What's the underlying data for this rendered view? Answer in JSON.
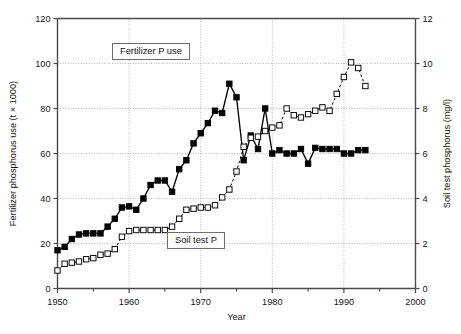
{
  "chart_data": {
    "type": "line",
    "title": "",
    "xlabel": "Year",
    "ylabel": "Fertilizer phosphorus use (t × 1000)",
    "y2label": "Soil test phosphorus (mg/l)",
    "xlim": [
      1950,
      2000
    ],
    "ylim": [
      0,
      120
    ],
    "y2lim": [
      0,
      12
    ],
    "xticks": [
      1950,
      1960,
      1970,
      1980,
      1990,
      2000
    ],
    "xtick_labels": [
      "1950",
      "1960",
      "1970",
      "1980",
      "1990",
      "2000"
    ],
    "xminor_ticks": [
      1955,
      1965,
      1975,
      1985,
      1995
    ],
    "yticks": [
      0,
      20,
      40,
      60,
      80,
      100,
      120
    ],
    "ytick_labels": [
      "0",
      "20",
      "40",
      "60",
      "80",
      "100",
      "120"
    ],
    "y2ticks": [
      0,
      2,
      4,
      6,
      8,
      10,
      12
    ],
    "y2tick_labels": [
      "0",
      "2",
      "4",
      "6",
      "8",
      "10",
      "12"
    ],
    "grid": true,
    "legend_position": "inline-annotations",
    "annotations": [
      {
        "text": "Fertilizer P use",
        "x": 1963.5,
        "y": 101
      },
      {
        "text": "Soil test P",
        "x": 1971.5,
        "y": 17
      }
    ],
    "series": [
      {
        "name": "Fertilizer P use",
        "axis": "left",
        "marker": "filled-square",
        "line_style": "solid",
        "color": "#000000",
        "units": "t × 1000",
        "x": [
          1950,
          1951,
          1952,
          1953,
          1954,
          1955,
          1956,
          1957,
          1958,
          1959,
          1960,
          1961,
          1962,
          1963,
          1964,
          1965,
          1966,
          1967,
          1968,
          1969,
          1970,
          1971,
          1972,
          1973,
          1974,
          1975,
          1976,
          1977,
          1978,
          1979,
          1980,
          1981,
          1982,
          1983,
          1984,
          1985,
          1986,
          1987,
          1988,
          1989,
          1990,
          1991,
          1992,
          1993
        ],
        "values": [
          17,
          18.5,
          22,
          24,
          24.5,
          24.5,
          24.5,
          27.5,
          31,
          36,
          36.5,
          35,
          40,
          46,
          48,
          48,
          43,
          53,
          57,
          64.5,
          69,
          73.5,
          79,
          78,
          91,
          85,
          57,
          68,
          62,
          80,
          60,
          61.5,
          60,
          60,
          62,
          55.5,
          62.5,
          62,
          62,
          62,
          60,
          60,
          61.5,
          61.5
        ]
      },
      {
        "name": "Soil test P",
        "axis": "right",
        "marker": "open-square",
        "line_style": "dashed",
        "color": "#000000",
        "units": "mg/l",
        "x": [
          1950,
          1951,
          1952,
          1953,
          1954,
          1955,
          1956,
          1957,
          1958,
          1959,
          1960,
          1961,
          1962,
          1963,
          1964,
          1965,
          1966,
          1967,
          1968,
          1969,
          1970,
          1971,
          1972,
          1973,
          1974,
          1975,
          1976,
          1977,
          1978,
          1979,
          1980,
          1981,
          1982,
          1983,
          1984,
          1985,
          1986,
          1987,
          1988,
          1989,
          1990,
          1991,
          1992,
          1993
        ],
        "values": [
          0.8,
          1.1,
          1.15,
          1.2,
          1.3,
          1.35,
          1.5,
          1.55,
          1.75,
          2.3,
          2.55,
          2.6,
          2.6,
          2.6,
          2.6,
          2.6,
          2.75,
          3.1,
          3.5,
          3.55,
          3.6,
          3.6,
          3.7,
          4.05,
          4.4,
          5.2,
          6.3,
          6.7,
          6.75,
          7.0,
          7.15,
          7.25,
          8.0,
          7.7,
          7.6,
          7.75,
          7.9,
          8.05,
          7.9,
          8.65,
          9.4,
          10.05,
          9.8,
          9.0
        ]
      }
    ]
  },
  "figure": {
    "left_axis_title": "Fertilizer phosphorus use (t × 1000)",
    "right_axis_title": "Soil test phosphorus (mg/l)",
    "x_axis_title": "Year"
  }
}
